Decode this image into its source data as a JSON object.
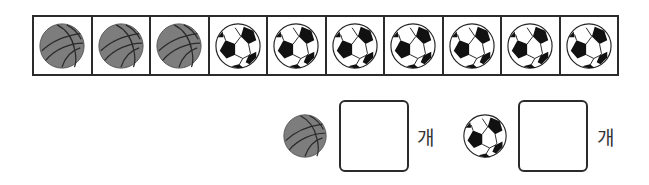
{
  "grid": {
    "items": [
      "basketball",
      "basketball",
      "basketball",
      "soccer",
      "soccer",
      "soccer",
      "soccer",
      "soccer",
      "soccer",
      "soccer"
    ]
  },
  "answers": [
    {
      "icon": "basketball",
      "value": "",
      "unit": "개"
    },
    {
      "icon": "soccer",
      "value": "",
      "unit": "개"
    }
  ],
  "colors": {
    "basketball": "#7d7d7d",
    "line": "#2b2b2b"
  }
}
